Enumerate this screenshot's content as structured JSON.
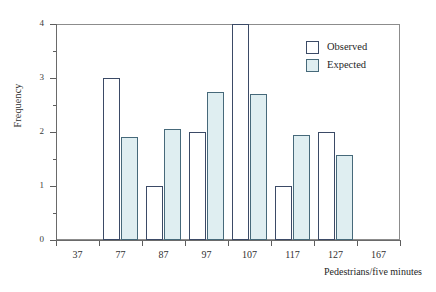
{
  "chart_data": {
    "type": "bar",
    "title": "",
    "subtitle": "",
    "xlabel": "Pedestrians/five minutes",
    "ylabel": "Frequency",
    "categories": [
      "77",
      "87",
      "97",
      "107",
      "117",
      "127"
    ],
    "x_tick_labels": [
      "37",
      "77",
      "87",
      "97",
      "107",
      "117",
      "127",
      "167"
    ],
    "y_tick_labels": [
      "0",
      "1",
      "2",
      "3",
      "4"
    ],
    "ylim": [
      0,
      4
    ],
    "y_major_ticks": [
      0,
      1,
      2,
      3,
      4
    ],
    "y_minor_ticks": [
      0.5,
      1.5,
      2.5,
      3.5
    ],
    "grid": false,
    "legend_position": "top-right",
    "series": [
      {
        "name": "Observed",
        "color": "#ffffff",
        "edge_color": "#3b4a66",
        "values": [
          3,
          1,
          2,
          4,
          1,
          2
        ]
      },
      {
        "name": "Expected",
        "color": "#dfeef1",
        "edge_color": "#46697a",
        "values": [
          1.9,
          2.05,
          2.75,
          2.7,
          1.95,
          1.57
        ]
      }
    ]
  },
  "legend": {
    "items": [
      {
        "label": "Observed",
        "swatch": "observed"
      },
      {
        "label": "Expected",
        "swatch": "expected"
      }
    ]
  },
  "colors": {
    "bar_outline": "#3b4a66",
    "expected_fill": "#dfeef1",
    "expected_outline": "#46697a",
    "frame": "#8c8c8c",
    "axis": "#6a6a6a",
    "text": "#2b2b2b"
  }
}
